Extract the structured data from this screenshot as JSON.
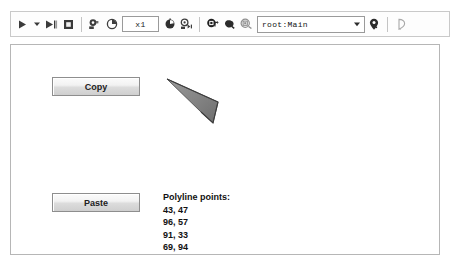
{
  "toolbar": {
    "buttons": [
      {
        "name": "play-button",
        "icon": "play-icon",
        "label": ""
      },
      {
        "name": "play-dropdown-button",
        "icon": "chevron-down-icon",
        "label": ""
      },
      {
        "name": "step-forward-button",
        "icon": "step-forward-icon",
        "label": ""
      },
      {
        "name": "stop-button",
        "icon": "stop-icon",
        "label": ""
      },
      {
        "name": "step-over-button",
        "icon": "step-over-icon",
        "label": ""
      },
      {
        "name": "pause-clock-button",
        "icon": "clock-pie-icon",
        "label": ""
      }
    ],
    "speed_field": {
      "value": "x1",
      "placeholder": "x1"
    },
    "buttons_right": [
      {
        "name": "timer-toggle-button",
        "icon": "clock-dark-icon",
        "label": ""
      },
      {
        "name": "fast-forward-button",
        "icon": "fast-forward-icon",
        "label": ""
      },
      {
        "name": "show-redraw-regions-button",
        "icon": "redraw-regions-icon",
        "label": ""
      },
      {
        "name": "object-inspect-button",
        "icon": "blob-dark-icon",
        "label": ""
      },
      {
        "name": "snapshot-button",
        "icon": "snapshot-icon",
        "label": ""
      }
    ],
    "target_combo": {
      "value": "root:Main",
      "placeholder": "root:Main"
    },
    "buttons_tail": [
      {
        "name": "pin-target-button",
        "icon": "pin-icon",
        "label": ""
      },
      {
        "name": "outline-mode-button",
        "icon": "outline-pin-icon",
        "label": ""
      }
    ]
  },
  "stage": {
    "copy_button": {
      "label": "Copy"
    },
    "paste_button": {
      "label": "Paste"
    },
    "points_panel": {
      "title": "Polyline points:",
      "points": [
        "43, 47",
        "96, 57",
        "91, 33",
        "69, 94"
      ]
    },
    "shape": {
      "name": "polyline-wedge",
      "fill": "#8a8a8a",
      "stroke": "#4a4a4a",
      "points": [
        [
          43,
          47
        ],
        [
          96,
          57
        ],
        [
          91,
          33
        ],
        [
          69,
          94
        ]
      ]
    }
  },
  "colors": {
    "toolbar_bg": "#fdfdfd",
    "toolbar_border": "#c9c9c9",
    "stage_border": "#b6b6b6",
    "button_face": "#e8e8e8",
    "text": "#111111"
  }
}
